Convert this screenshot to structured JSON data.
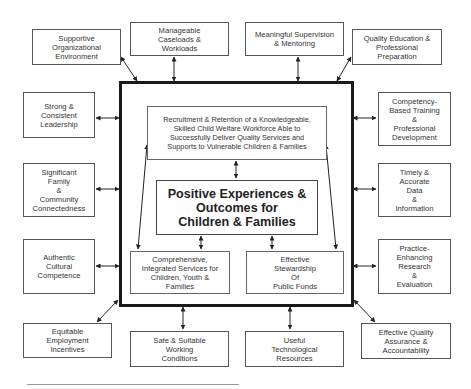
{
  "diagram": {
    "center": {
      "goal": "Recruitment & Retention of a Knowledgeable,\nSkilled Child Welfare Workforce Able to\nSuccessfully Deliver Quality Services and\nSupports to Vulnerable Children & Families",
      "outcome": "Positive Experiences &\nOutcomes for\nChildren & Families",
      "services": "Comprehensive,\nIntegrated Services for\nChildren, Youth &\nFamilies",
      "stewardship": "Effective\nStewardship\nOf\nPublic Funds"
    },
    "top": [
      "Supportive\nOrganizational\nEnvironment",
      "Manageable\nCaseloads &\nWorkloads",
      "Meaningful Supervision\n& Mentoring",
      "Quality Education &\nProfessional\nPreparation"
    ],
    "left": [
      "Strong &\nConsistent\nLeadership",
      "Significant\nFamily\n&\nCommunity\nConnectedness",
      "Authentic\nCultural\nCompetence"
    ],
    "right": [
      "Competency-\nBased Training\n&\nProfessional\nDevelopment",
      "Timely &\nAccurate\nData\n&\nInformation",
      "Practice-\nEnhancing\nResearch\n&\nEvaluation"
    ],
    "bottom": [
      "Equitable\nEmployment\nIncentives",
      "Safe & Suitable\nWorking\nConditions",
      "Useful\nTechnological\nResources",
      "Effective Quality\nAssurance &\nAccountability"
    ]
  }
}
